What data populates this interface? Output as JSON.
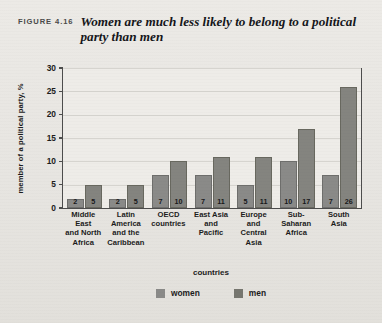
{
  "figure": {
    "label": "FIGURE 4.16",
    "title": "Women are much less likely to belong to a political party than men"
  },
  "legend": {
    "women_label": "women",
    "men_label": "men",
    "women_color": "#8a8a88",
    "men_color": "#76766f"
  },
  "chart_data": {
    "type": "bar",
    "title": "Women are much less likely to belong to a political party than men",
    "xlabel": "countries",
    "ylabel": "member of a political party, %",
    "ylim": [
      0,
      30
    ],
    "yticks": [
      0,
      5,
      10,
      15,
      20,
      25,
      30
    ],
    "ytick_labels": [
      "0",
      "5",
      "10",
      "15",
      "20",
      "25",
      "30"
    ],
    "grid": true,
    "legend_position": "bottom-center",
    "categories": [
      "Middle East and North Africa",
      "Latin America and the Caribbean",
      "OECD countries",
      "East Asia and Pacific",
      "Europe and Central Asia",
      "Sub-Saharan Africa",
      "South Asia"
    ],
    "category_lines": [
      [
        "Middle East",
        "and North",
        "Africa"
      ],
      [
        "Latin",
        "America",
        "and the",
        "Caribbean"
      ],
      [
        "OECD",
        "countries"
      ],
      [
        "East Asia",
        "and",
        "Pacific"
      ],
      [
        "Europe",
        "and",
        "Central",
        "Asia"
      ],
      [
        "Sub-Saharan",
        "Africa"
      ],
      [
        "South",
        "Asia"
      ]
    ],
    "series": [
      {
        "name": "women",
        "values": [
          2,
          2,
          7,
          7,
          5,
          10,
          7
        ]
      },
      {
        "name": "men",
        "values": [
          5,
          5,
          10,
          11,
          11,
          17,
          26
        ]
      }
    ]
  }
}
